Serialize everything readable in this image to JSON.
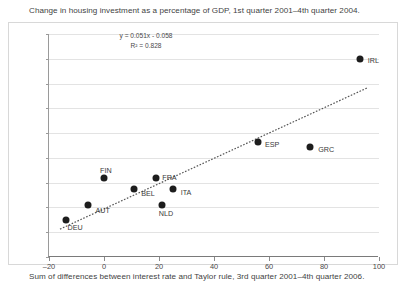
{
  "chart_data": {
    "type": "scatter",
    "title": "Change in housing investment as a percentage of GDP, 1st quarter 2001–4th quarter 2004.",
    "xlabel": "Sum of differences between interest rate and Taylor rule, 3rd quarter 2001–4th quarter 2006.",
    "ylabel": "",
    "xlim": [
      -20,
      100
    ],
    "ylim": [
      -2,
      7
    ],
    "xticks": [
      -20,
      0,
      20,
      40,
      60,
      80,
      100
    ],
    "yticks": [
      7,
      6,
      5,
      4,
      3,
      2,
      1,
      0,
      -1,
      -2
    ],
    "grid": "horizontal",
    "legend": "none",
    "marker_color": "#1d1d1d",
    "trendline": {
      "equation": "y = 0.051x - 0.058",
      "r_squared": "R² = 0.828",
      "slope": 0.051,
      "intercept": -0.058,
      "style": "dotted",
      "color": "#555555"
    },
    "points": [
      {
        "label": "DEU",
        "x": -14,
        "y": -0.5,
        "label_dx": 2,
        "label_dy": 7
      },
      {
        "label": "AUT",
        "x": -6,
        "y": 0.1,
        "label_dx": 8,
        "label_dy": 5
      },
      {
        "label": "FIN",
        "x": 0,
        "y": 1.2,
        "label_dx": -4,
        "label_dy": -8
      },
      {
        "label": "BEL",
        "x": 11,
        "y": 0.75,
        "label_dx": 7,
        "label_dy": 4
      },
      {
        "label": "FRA",
        "x": 19,
        "y": 1.2,
        "label_dx": 6,
        "label_dy": -1
      },
      {
        "label": "NLD",
        "x": 21,
        "y": 0.1,
        "label_dx": -3,
        "label_dy": 8
      },
      {
        "label": "ITA",
        "x": 25,
        "y": 0.75,
        "label_dx": 8,
        "label_dy": 3
      },
      {
        "label": "ESP",
        "x": 56,
        "y": 2.65,
        "label_dx": 7,
        "label_dy": 2
      },
      {
        "label": "GRC",
        "x": 75,
        "y": 2.45,
        "label_dx": 8,
        "label_dy": 2
      },
      {
        "label": "IRL",
        "x": 93,
        "y": 6.0,
        "label_dx": 8,
        "label_dy": 1
      }
    ]
  }
}
